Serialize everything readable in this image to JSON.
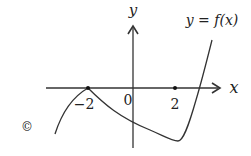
{
  "figure": {
    "option_marker": "©",
    "curve_label": "y = f(x)",
    "axes": {
      "x_label": "x",
      "y_label": "y",
      "origin_label": "0"
    },
    "ticks": [
      {
        "value": -2,
        "label": "−2"
      },
      {
        "value": 2,
        "label": "2"
      }
    ],
    "colors": {
      "stroke": "#333333",
      "text": "#222222",
      "background": "#ffffff"
    }
  }
}
